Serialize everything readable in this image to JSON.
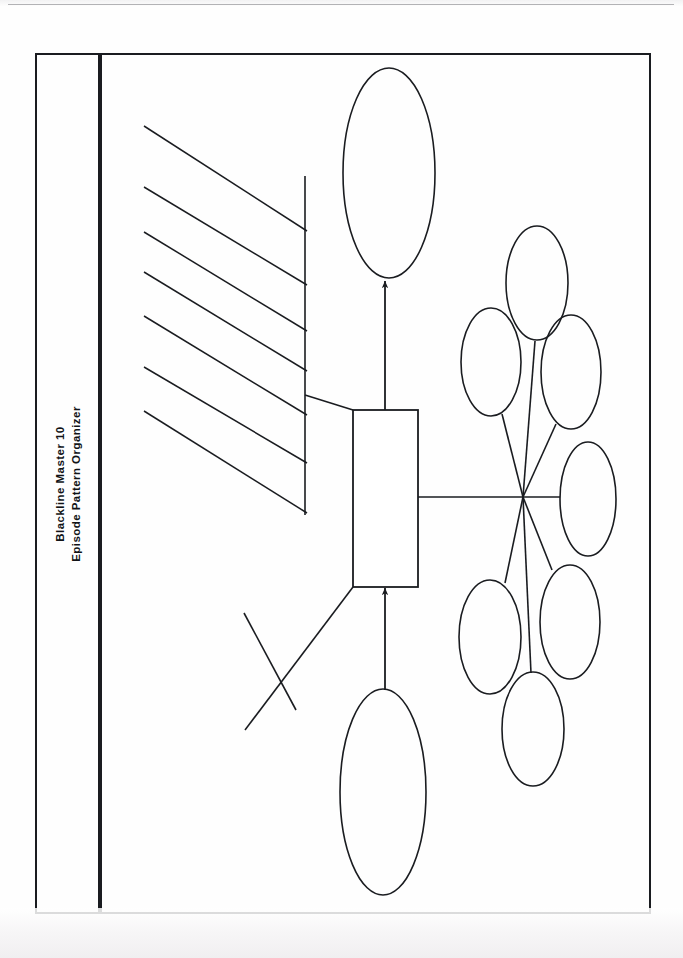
{
  "document": {
    "master_label": "Blackline Master 10",
    "organizer_title": "Episode Pattern Organizer",
    "page_background": "#fefefe",
    "ink_color": "#1a1c20"
  },
  "frame": {
    "outer_border": {
      "x": 36,
      "y": 54,
      "width": 614,
      "height": 859,
      "stroke": "#1a1c20",
      "stroke_width": 2
    },
    "spine_divider": {
      "x": 100,
      "y1": 54,
      "y2": 913,
      "stroke": "#111316",
      "stroke_width": 4
    }
  },
  "diagram": {
    "name": "episode-pattern-organizer",
    "center_box": {
      "label": "central-episode-box",
      "x": 353,
      "y": 410,
      "width": 65,
      "height": 177
    },
    "top_ellipse": {
      "label": "outcome-ellipse",
      "cx": 389,
      "cy": 173,
      "rx": 46,
      "ry": 105
    },
    "bottom_ellipse": {
      "label": "initiating-event-ellipse",
      "cx": 383,
      "cy": 792,
      "rx": 43,
      "ry": 103
    },
    "arrows": [
      {
        "label": "arrow-box-to-top-ellipse",
        "x1": 385,
        "y1": 410,
        "x2": 385,
        "y2": 281
      },
      {
        "label": "arrow-bottom-ellipse-to-box",
        "x1": 385,
        "y1": 690,
        "x2": 385,
        "y2": 588
      }
    ],
    "connector_to_hub": {
      "label": "box-to-hub-line",
      "x1": 418,
      "y1": 497,
      "x2": 523,
      "y2": 497
    },
    "writing_lines": {
      "label": "response-writing-lines",
      "count": 7,
      "vertical_rule": {
        "x": 305,
        "y1": 176,
        "y2": 515
      },
      "lines": [
        {
          "x1": 144,
          "y1": 126,
          "x2": 307,
          "y2": 231
        },
        {
          "x1": 144,
          "y1": 187,
          "x2": 307,
          "y2": 285
        },
        {
          "x1": 144,
          "y1": 232,
          "x2": 307,
          "y2": 331
        },
        {
          "x1": 144,
          "y1": 272,
          "x2": 307,
          "y2": 371
        },
        {
          "x1": 144,
          "y1": 316,
          "x2": 307,
          "y2": 415
        },
        {
          "x1": 144,
          "y1": 367,
          "x2": 307,
          "y2": 463
        },
        {
          "x1": 144,
          "y1": 411,
          "x2": 307,
          "y2": 513
        }
      ]
    },
    "upper_leader": {
      "label": "upper-leader-line",
      "x1": 305,
      "y1": 395,
      "x2": 353,
      "y2": 410
    },
    "cross_mark": {
      "label": "crossed-out-leader",
      "leader": {
        "x1": 353,
        "y1": 587,
        "x2": 245,
        "y2": 730
      },
      "strike": {
        "x1": 244,
        "y1": 613,
        "x2": 296,
        "y2": 710
      }
    },
    "radial_cluster": {
      "label": "attempt-radial-cluster",
      "hub": {
        "cx": 523,
        "cy": 497
      },
      "ellipse_count": 7,
      "ellipses": [
        {
          "label": "radial-ellipse-1",
          "cx": 537,
          "cy": 283,
          "rx": 31,
          "ry": 57
        },
        {
          "label": "radial-ellipse-2",
          "cx": 491,
          "cy": 362,
          "rx": 30,
          "ry": 54
        },
        {
          "label": "radial-ellipse-3",
          "cx": 571,
          "cy": 372,
          "rx": 30,
          "ry": 57
        },
        {
          "label": "radial-ellipse-4",
          "cx": 588,
          "cy": 499,
          "rx": 28,
          "ry": 57
        },
        {
          "label": "radial-ellipse-5",
          "cx": 570,
          "cy": 622,
          "rx": 30,
          "ry": 57
        },
        {
          "label": "radial-ellipse-6",
          "cx": 490,
          "cy": 637,
          "rx": 31,
          "ry": 57
        },
        {
          "label": "radial-ellipse-7",
          "cx": 533,
          "cy": 729,
          "rx": 31,
          "ry": 57
        }
      ],
      "spokes": [
        {
          "label": "spoke-1",
          "x1": 523,
          "y1": 497,
          "x2": 535,
          "y2": 341
        },
        {
          "label": "spoke-2",
          "x1": 523,
          "y1": 497,
          "x2": 502,
          "y2": 414
        },
        {
          "label": "spoke-3",
          "x1": 523,
          "y1": 497,
          "x2": 556,
          "y2": 424
        },
        {
          "label": "spoke-4",
          "x1": 523,
          "y1": 497,
          "x2": 560,
          "y2": 497
        },
        {
          "label": "spoke-5",
          "x1": 523,
          "y1": 497,
          "x2": 552,
          "y2": 570
        },
        {
          "label": "spoke-6",
          "x1": 523,
          "y1": 497,
          "x2": 505,
          "y2": 583
        },
        {
          "label": "spoke-7",
          "x1": 523,
          "y1": 497,
          "x2": 531,
          "y2": 673
        }
      ]
    }
  }
}
